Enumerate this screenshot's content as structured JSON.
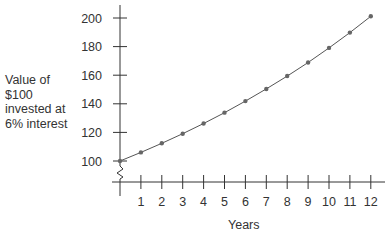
{
  "chart_data": {
    "type": "line",
    "title": "",
    "xlabel": "Years",
    "ylabel_lines": [
      "Value of",
      "$100",
      "invested at",
      "6% interest"
    ],
    "ylabel": "Value of $100 invested at 6% interest",
    "x": [
      0,
      1,
      2,
      3,
      4,
      5,
      6,
      7,
      8,
      9,
      10,
      11,
      12
    ],
    "series": [
      {
        "name": "Value of $100 at 6% interest",
        "values": [
          100,
          106,
          112.4,
          119.1,
          126.2,
          133.8,
          141.9,
          150.4,
          159.4,
          168.9,
          179.1,
          189.8,
          201.2
        ]
      }
    ],
    "xticks": [
      "1",
      "2",
      "3",
      "4",
      "5",
      "6",
      "7",
      "8",
      "9",
      "10",
      "11",
      "12"
    ],
    "yticks": [
      "100",
      "120",
      "140",
      "160",
      "180",
      "200"
    ],
    "ylim": [
      100,
      200
    ],
    "xlim": [
      0,
      12
    ],
    "axis_break": true,
    "grid": false,
    "legend": "none",
    "colors": {
      "line": "#555555",
      "marker": "#666666",
      "axis": "#333333"
    }
  }
}
